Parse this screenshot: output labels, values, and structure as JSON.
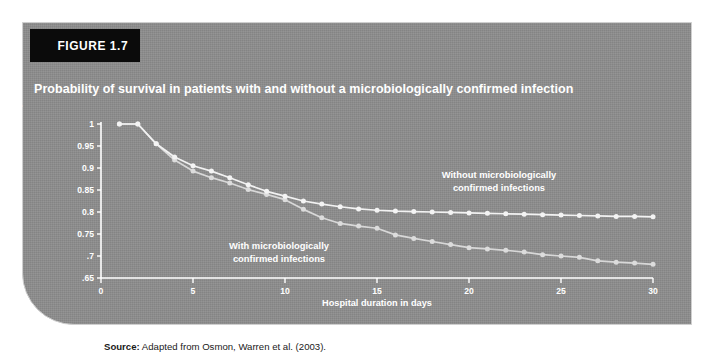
{
  "figure": {
    "tab_label": "FIGURE 1.7",
    "title": "Probability of survival in patients with and without a microbiologically confirmed infection",
    "source_prefix": "Source:",
    "source_text": " Adapted from Osmon, Warren et al. (2003)."
  },
  "colors": {
    "panel_background": "#8d8d8d",
    "tab_background": "#0b0b0b",
    "line_without": "#f2f2f2",
    "line_with": "#dcdcdc",
    "text": "#ffffff"
  },
  "annotations": {
    "without_line1": "Without microbiologically",
    "without_line2": "confirmed infections",
    "with_line1": "With microbiologically",
    "with_line2": "confirmed infections"
  },
  "chart_data": {
    "type": "line",
    "title": "Probability of survival in patients with and without a microbiologically confirmed infection",
    "xlabel": "Hospital duration in days",
    "ylabel": "Probability of survival",
    "xlim": [
      0,
      30
    ],
    "ylim": [
      0.65,
      1.0
    ],
    "grid": false,
    "legend_position": "inline-annotations",
    "xticks": [
      0,
      5,
      10,
      15,
      20,
      25,
      30
    ],
    "xtick_labels": [
      "0",
      "5",
      "10",
      "15",
      "20",
      "25",
      "30"
    ],
    "yticks": [
      0.65,
      0.7,
      0.75,
      0.8,
      0.85,
      0.9,
      0.95,
      1
    ],
    "ytick_labels": [
      ".65",
      ".7",
      "0.75",
      "0.8",
      "0.85",
      "0.9",
      "0.95",
      "1"
    ],
    "x": [
      1,
      2,
      3,
      4,
      5,
      6,
      7,
      8,
      9,
      10,
      11,
      12,
      13,
      14,
      15,
      16,
      17,
      18,
      19,
      20,
      21,
      22,
      23,
      24,
      25,
      26,
      27,
      28,
      29,
      30
    ],
    "series": [
      {
        "name": "Without microbiologically confirmed infections",
        "values": [
          1.0,
          1.0,
          0.955,
          0.925,
          0.905,
          0.893,
          0.878,
          0.862,
          0.847,
          0.836,
          0.825,
          0.818,
          0.812,
          0.807,
          0.804,
          0.802,
          0.801,
          0.8,
          0.799,
          0.798,
          0.797,
          0.796,
          0.795,
          0.794,
          0.793,
          0.792,
          0.791,
          0.79,
          0.79,
          0.789
        ]
      },
      {
        "name": "With microbiologically confirmed infections",
        "values": [
          1.0,
          1.0,
          0.955,
          0.918,
          0.893,
          0.878,
          0.866,
          0.851,
          0.84,
          0.828,
          0.806,
          0.787,
          0.774,
          0.768,
          0.763,
          0.748,
          0.74,
          0.733,
          0.726,
          0.719,
          0.716,
          0.713,
          0.709,
          0.703,
          0.7,
          0.697,
          0.689,
          0.686,
          0.684,
          0.681
        ]
      }
    ]
  }
}
